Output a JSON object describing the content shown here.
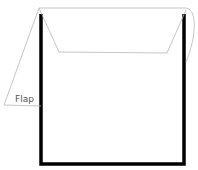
{
  "diagram": {
    "title": "",
    "labels": {
      "flap": "Flap"
    },
    "colors": {
      "envelope_outline": "#000000",
      "flap_outline": "#b0b0b0",
      "label_text": "#555555",
      "background": "#ffffff"
    }
  }
}
